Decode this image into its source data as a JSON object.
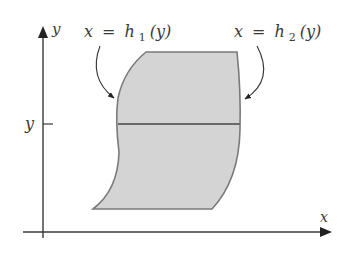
{
  "diagram": {
    "axes": {
      "x_label": "x",
      "y_label": "y",
      "y_tick_label": "y"
    },
    "annotations": {
      "left_curve": {
        "var": "x",
        "eq": "=",
        "func": "h",
        "sub": "1",
        "arg": "(y)"
      },
      "right_curve": {
        "var": "x",
        "eq": "=",
        "func": "h",
        "sub": "2",
        "arg": "(y)"
      }
    },
    "colors": {
      "region_fill": "#d4d4d4",
      "region_stroke": "#7a7a7a",
      "axis": "#3a3a3a",
      "strip_line": "#6a6a6a"
    }
  }
}
